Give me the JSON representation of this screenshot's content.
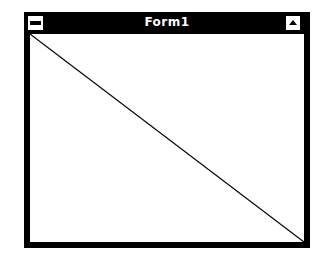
{
  "window": {
    "title": "Form1",
    "system_menu_icon": "system-menu-icon",
    "maximize_icon": "maximize-triangle-icon"
  },
  "client": {
    "drawing": {
      "type": "line",
      "from": "top-left",
      "to": "bottom-right",
      "color": "#000000"
    }
  },
  "colors": {
    "frame": "#000000",
    "title_text": "#ffffff",
    "client_bg": "#ffffff"
  }
}
